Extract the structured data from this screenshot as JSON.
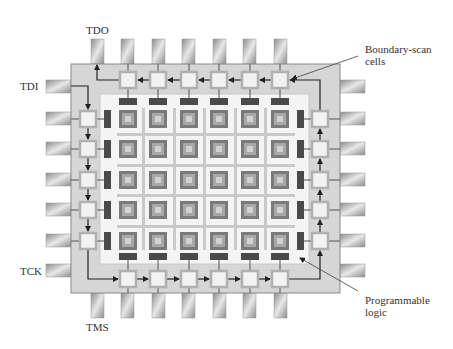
{
  "figure": {
    "labels": {
      "tdo": "TDO",
      "tdi": "TDI",
      "tck": "TCK",
      "tms": "TMS",
      "boundary_scan_line1": "Boundary-scan",
      "boundary_scan_line2": "cells",
      "prog_logic_line1": "Programmable",
      "prog_logic_line2": "logic"
    },
    "colors": {
      "chip_body": "#d6d6d6",
      "chip_border": "#8a8a8a",
      "inner_area": "#f4f4f4",
      "grid_line": "#c9c9c9",
      "logic_block_outer": "#7a7a7a",
      "logic_block_mid": "#a8a8a8",
      "logic_block_inner": "#d2d2d2",
      "scan_cell_fill": "#f2f2f2",
      "scan_cell_border": "#b0b0b0",
      "io_bar": "#4a4a4a",
      "wire": "#333333",
      "pin": "#b8b8b8"
    },
    "grid": {
      "rows": 5,
      "cols": 6
    },
    "pins_per_side": 7,
    "scan_chain_order": "TDI → left column (down) → bottom row (right) → right column (up) → top row (left) → TDO"
  }
}
